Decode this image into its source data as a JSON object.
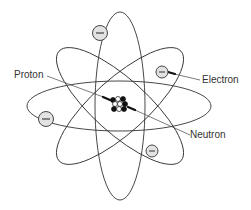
{
  "diagram": {
    "labels": {
      "proton": "Proton",
      "electron": "Electron",
      "neutron": "Neutron"
    },
    "electron_symbol": "−",
    "electron_count": 4,
    "orbit_count": 4,
    "colors": {
      "line": "#333333",
      "electron_fill": "#e2e2e2",
      "proton_fill": "#111111",
      "neutron_fill": "#ffffff"
    }
  }
}
